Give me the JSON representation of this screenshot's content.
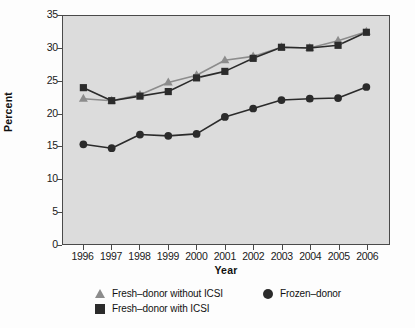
{
  "chart_data": {
    "type": "line",
    "title": "",
    "xlabel": "Year",
    "ylabel": "Percent",
    "categories": [
      "1996",
      "1997",
      "1998",
      "1999",
      "2000",
      "2001",
      "2002",
      "2003",
      "2004",
      "2005",
      "2006"
    ],
    "ylim": [
      0,
      35
    ],
    "yticks": [
      0,
      5,
      10,
      15,
      20,
      25,
      30,
      35
    ],
    "grid": false,
    "legend_position": "below-plot",
    "series": [
      {
        "name": "Fresh–donor without ICSI",
        "marker": "triangle",
        "color": "#8c8c8c",
        "values": [
          22.3,
          22.0,
          22.9,
          24.8,
          25.9,
          28.2,
          28.8,
          30.2,
          30.1,
          31.2,
          32.6
        ]
      },
      {
        "name": "Fresh–donor with ICSI",
        "marker": "square",
        "color": "#2b2b2b",
        "values": [
          24.0,
          22.0,
          22.7,
          23.4,
          25.5,
          26.5,
          28.5,
          30.2,
          30.1,
          30.5,
          32.5
        ]
      },
      {
        "name": "Frozen–donor",
        "marker": "circle",
        "color": "#2b2b2b",
        "values": [
          15.3,
          14.7,
          16.8,
          16.6,
          16.9,
          19.5,
          20.8,
          22.1,
          22.3,
          22.4,
          24.1
        ]
      }
    ]
  },
  "axes": {
    "ylabel": "Percent",
    "xlabel": "Year",
    "ytick_labels": [
      "0",
      "5",
      "10",
      "15",
      "20",
      "25",
      "30",
      "35"
    ],
    "xtick_labels": [
      "1996",
      "1997",
      "1998",
      "1999",
      "2000",
      "2001",
      "2002",
      "2003",
      "2004",
      "2005",
      "2006"
    ]
  },
  "legend": {
    "items": [
      {
        "label": "Fresh–donor without ICSI",
        "marker": "triangle-icon"
      },
      {
        "label": "Fresh–donor with ICSI",
        "marker": "square-icon"
      },
      {
        "label": "Frozen–donor",
        "marker": "circle-icon"
      }
    ]
  },
  "colors": {
    "plot_background": "#dcdcdc",
    "page_background": "#fdfdfd",
    "axis": "#4a4a4a",
    "series_light": "#8c8c8c",
    "series_dark": "#2b2b2b"
  }
}
